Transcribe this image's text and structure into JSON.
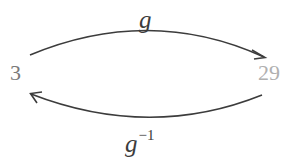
{
  "diagram": {
    "nodes": [
      {
        "id": "left",
        "label": "3",
        "color": "#7a7a7a"
      },
      {
        "id": "right",
        "label": "29",
        "color": "#b0b0b0"
      }
    ],
    "edges": [
      {
        "from": "left",
        "to": "right",
        "label": "g",
        "position": "top"
      },
      {
        "from": "right",
        "to": "left",
        "label": "g",
        "superscript": "−1",
        "position": "bottom"
      }
    ],
    "stroke_color": "#3c3c3c"
  }
}
